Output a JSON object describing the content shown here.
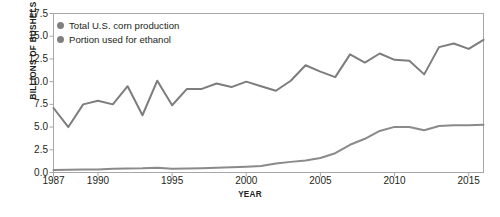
{
  "chart_data": {
    "type": "line",
    "title": "",
    "xlabel": "YEAR",
    "ylabel": "BILLIONS OF BUSHELS",
    "xlim": [
      1987,
      2016
    ],
    "ylim": [
      0.0,
      17.5
    ],
    "grid": false,
    "legend_position": "top-left",
    "x": [
      1987,
      1988,
      1989,
      1990,
      1991,
      1992,
      1993,
      1994,
      1995,
      1996,
      1997,
      1998,
      1999,
      2000,
      2001,
      2002,
      2003,
      2004,
      2005,
      2006,
      2007,
      2008,
      2009,
      2010,
      2011,
      2012,
      2013,
      2014,
      2015,
      2016
    ],
    "xticks": [
      1987,
      1990,
      1995,
      2000,
      2005,
      2010,
      2015
    ],
    "xticklabels": [
      "1987",
      "1990",
      "1995",
      "2000",
      "2005",
      "2010",
      "2015"
    ],
    "yticks": [
      0.0,
      2.5,
      5.0,
      7.5,
      10.0,
      12.5,
      15.0,
      17.5
    ],
    "yticklabels": [
      "0.0",
      "2.5",
      "5.0",
      "7.5",
      "10.0",
      "12.5",
      "15.0",
      "17.5"
    ],
    "series": [
      {
        "name": "Total U.S. corn production",
        "color": "#7d7d7d",
        "values": [
          7.1,
          5.0,
          7.5,
          7.9,
          7.5,
          9.5,
          6.3,
          10.1,
          7.4,
          9.2,
          9.2,
          9.8,
          9.4,
          10.0,
          9.5,
          9.0,
          10.1,
          11.8,
          11.1,
          10.5,
          13.0,
          12.1,
          13.1,
          12.4,
          12.3,
          10.8,
          13.8,
          14.2,
          13.6,
          14.6
        ]
      },
      {
        "name": "Portion used for ethanol",
        "color": "#8a8a8a",
        "values": [
          0.28,
          0.3,
          0.32,
          0.33,
          0.4,
          0.43,
          0.46,
          0.53,
          0.4,
          0.43,
          0.48,
          0.53,
          0.57,
          0.63,
          0.71,
          0.99,
          1.17,
          1.32,
          1.6,
          2.12,
          3.05,
          3.71,
          4.57,
          5.02,
          5.0,
          4.65,
          5.12,
          5.2,
          5.2,
          5.25
        ]
      }
    ]
  },
  "legend": {
    "items": [
      {
        "label": "Total U.S. corn production",
        "color": "#808080"
      },
      {
        "label": "Portion used for ethanol",
        "color": "#808080"
      }
    ]
  },
  "axes": {
    "frame_color": "#a7a7a7",
    "tick_color": "#a7a7a7"
  }
}
